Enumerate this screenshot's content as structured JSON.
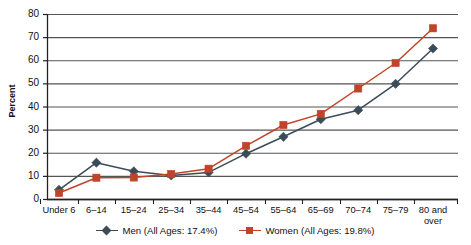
{
  "chart_data": {
    "type": "line",
    "title": "",
    "xlabel": "",
    "ylabel": "Percent",
    "ylim": [
      0,
      80
    ],
    "ytick_step": 10,
    "yticks": [
      "80",
      "70",
      "60",
      "50",
      "40",
      "30",
      "20",
      "10",
      "0"
    ],
    "grid": true,
    "legend_position": "bottom",
    "categories": [
      "Under 6",
      "6–14",
      "15–24",
      "25–34",
      "35–44",
      "45–54",
      "55–64",
      "65–69",
      "70–74",
      "75–79",
      "80 and\nover"
    ],
    "series": [
      {
        "name": "Men (All Ages: 17.4%)",
        "color": "#3b4b57",
        "marker": "diamond",
        "values": [
          4.0,
          15.7,
          12.0,
          10.2,
          11.5,
          19.6,
          26.9,
          34.5,
          38.4,
          49.8,
          65.1
        ]
      },
      {
        "name": "Women (All Ages: 19.8%)",
        "color": "#c0442a",
        "marker": "square",
        "values": [
          2.6,
          9.2,
          9.3,
          10.8,
          13.1,
          23.0,
          32.0,
          36.8,
          47.8,
          58.8,
          73.8
        ]
      }
    ],
    "annotations": [
      {
        "series": "Women (All Ages: 19.8%)",
        "category": "80 and over",
        "text": "73.8%"
      },
      {
        "series": "Men (All Ages: 17.4%)",
        "category": "80 and over",
        "text": "65.1%"
      }
    ]
  },
  "legend": {
    "items": [
      {
        "label": "Men (All Ages: 17.4%)",
        "color": "#3b4b57",
        "marker": "diamond-marker"
      },
      {
        "label": "Women (All Ages: 19.8%)",
        "color": "#c0442a",
        "marker": "square-marker"
      }
    ]
  },
  "colors": {
    "men": "#3b4b57",
    "women": "#c0442a",
    "grid": "#555555",
    "axis": "#222222",
    "background": "#ffffff"
  }
}
